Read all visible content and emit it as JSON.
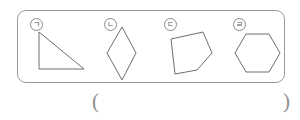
{
  "worksheet": {
    "container": {
      "name": "shape-group-box",
      "border_color": "#9a9a9a",
      "background": "#ffffff",
      "corner_radius_px": 9
    },
    "stroke_color": "#6f6f6f",
    "label_color": "#5d5d5d",
    "figures": [
      {
        "label": "ㄹ\u0000",
        "marker": "ㄱ",
        "marker_display": "ㄱ",
        "ordinal": "ㄱ",
        "name": "right-triangle",
        "shape_type": "right triangle",
        "sides": 4,
        "vertices": "38,31 38,68 83,68"
      },
      {
        "marker": "ㄴ",
        "name": "rhombus",
        "shape_type": "rhombus",
        "sides": 4,
        "vertices": "121,26 106,52 121,79 135,52"
      },
      {
        "marker": "ㄷ",
        "name": "irregular-pentagon",
        "shape_type": "pentagon",
        "sides": 5,
        "vertices": "170,38 202,31 211,52 196,69 174,73"
      },
      {
        "marker": "ㄹ",
        "name": "regular-hexagon",
        "shape_type": "hexagon",
        "sides": 6,
        "vertices": "245,33 268,33 279,52 268,71 245,71 234,52"
      }
    ],
    "answer": {
      "open_paren": "(",
      "close_paren": ")",
      "value": ""
    }
  }
}
